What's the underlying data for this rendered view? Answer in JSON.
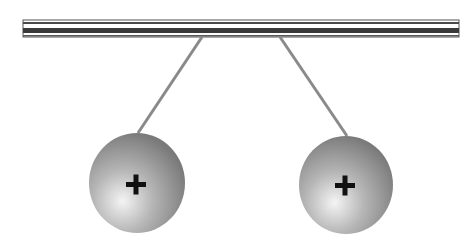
{
  "diagram": {
    "rod": {
      "x": 23,
      "y": 20,
      "width": 436,
      "height": 17
    },
    "spheres": [
      {
        "id": "left",
        "charge": "+",
        "cx": 137,
        "cy": 183,
        "r": 49,
        "string": {
          "x1": 202,
          "y1": 37,
          "x2": 138,
          "y2": 133
        }
      },
      {
        "id": "right",
        "charge": "+",
        "cx": 346,
        "cy": 185,
        "r": 48,
        "string": {
          "x1": 280,
          "y1": 37,
          "x2": 347,
          "y2": 136
        }
      }
    ],
    "colors": {
      "rod_dark": "#3a3a3a",
      "rod_light": "#f2f2f2",
      "string": "#8a8a8a",
      "sphere_dark": "#7a7a7a",
      "sphere_light": "#f0f0f0",
      "charge_sign": "#111111"
    }
  }
}
